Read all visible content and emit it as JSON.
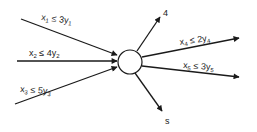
{
  "diagram": {
    "node": {
      "label": ""
    },
    "inputs": [
      {
        "var": "x",
        "idx": "1",
        "rel": "≤",
        "coef": "3y",
        "cidx": "1"
      },
      {
        "var": "x",
        "idx": "2",
        "rel": "≤",
        "coef": "4y",
        "cidx": "2"
      },
      {
        "var": "x",
        "idx": "3",
        "rel": "≤",
        "coef": "5y",
        "cidx": "3"
      }
    ],
    "outputs": [
      {
        "label": "4"
      },
      {
        "var": "x",
        "idx": "4",
        "rel": "≤",
        "coef": "2y",
        "cidx": "4"
      },
      {
        "var": "x",
        "idx": "5",
        "rel": "≤",
        "coef": "3y",
        "cidx": "5"
      },
      {
        "label": "s"
      }
    ],
    "colors": {
      "stroke": "#1a1a1a",
      "background": "#ffffff"
    }
  }
}
